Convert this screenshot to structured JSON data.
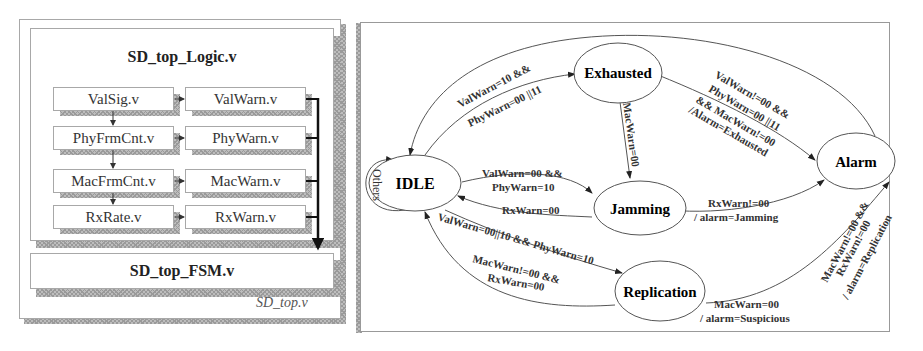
{
  "left_panel": {
    "outer_label": "SD_top.v",
    "logic_block": {
      "title": "SD_top_Logic.v",
      "rows": [
        {
          "left": "ValSig.v",
          "right": "ValWarn.v"
        },
        {
          "left": "PhyFrmCnt.v",
          "right": "PhyWarn.v"
        },
        {
          "left": "MacFrmCnt.v",
          "right": "MacWarn.v"
        },
        {
          "left": "RxRate.v",
          "right": "RxWarn.v"
        }
      ]
    },
    "fsm_block": {
      "title": "SD_top_FSM.v"
    }
  },
  "state_machine": {
    "states": {
      "idle": "IDLE",
      "exhausted": "Exhausted",
      "jamming": "Jamming",
      "replication": "Replication",
      "alarm": "Alarm"
    },
    "transitions": {
      "idle_self": "Others",
      "idle_to_exhausted_1": "ValWarn=10 &&",
      "idle_to_exhausted_2": "PhyWarn=00 ||11",
      "exhausted_to_jamming": "MacWarn=00",
      "exhausted_to_alarm_1": "ValWarn!=00 &&",
      "exhausted_to_alarm_2": "PhyWarn=00 ||11",
      "exhausted_to_alarm_3": "&& MacWarn!=00",
      "exhausted_to_alarm_4": "/Alarm=Exhausted",
      "idle_to_jamming_1": "ValWarn=00 &&",
      "idle_to_jamming_2": "PhyWarn=10",
      "jamming_to_idle": "RxWarn=00",
      "jamming_to_alarm_1": "RxWarn!=00",
      "jamming_to_alarm_2": "/ alarm=Jamming",
      "idle_to_replication": "ValWarn=00||10 && PhyWarn=10",
      "replication_to_idle_1": "MacWarn!=00 &&",
      "replication_to_idle_2": "RxWarn=00",
      "replication_to_suspicious_1": "MacWarn=00",
      "replication_to_suspicious_2": "/ alarm=Suspicious",
      "replication_to_alarm_1": "MacWarn!=00 &&",
      "replication_to_alarm_2": "RxWarn!=00",
      "replication_to_alarm_3": "/ alarm=Replication"
    }
  }
}
